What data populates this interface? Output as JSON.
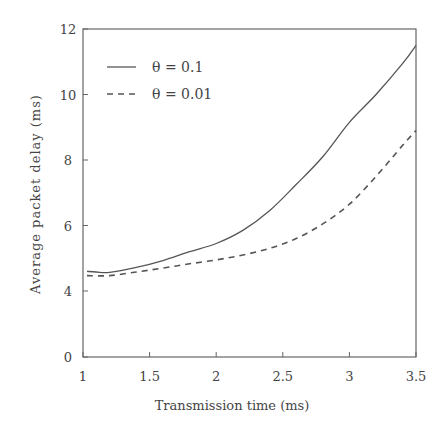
{
  "chart_data": {
    "type": "line",
    "title": "",
    "xlabel": "Transmission time (ms)",
    "ylabel": "Average packet delay (ms)",
    "xlim": [
      1,
      3.5
    ],
    "ylim": [
      0,
      12
    ],
    "y_axis_break": "axis jumps from 0 directly to 4 (no 2 tick)",
    "x_ticks": [
      "1",
      "1.5",
      "2",
      "2.5",
      "3",
      "3.5"
    ],
    "y_ticks": [
      "0",
      "4",
      "6",
      "8",
      "10",
      "12"
    ],
    "grid": false,
    "legend_position": "upper left",
    "series": [
      {
        "name": "θ = 0.1",
        "style": "solid",
        "x": [
          1.03,
          1.1,
          1.2,
          1.4,
          1.6,
          1.8,
          2.0,
          2.2,
          2.4,
          2.6,
          2.8,
          3.0,
          3.2,
          3.4,
          3.5
        ],
        "values": [
          4.6,
          4.58,
          4.57,
          4.72,
          4.93,
          5.2,
          5.45,
          5.85,
          6.45,
          7.25,
          8.1,
          9.15,
          10.0,
          10.95,
          11.5
        ]
      },
      {
        "name": "θ = 0.01",
        "style": "dashed",
        "x": [
          1.03,
          1.2,
          1.4,
          1.6,
          1.8,
          2.0,
          2.2,
          2.4,
          2.6,
          2.8,
          3.0,
          3.2,
          3.4,
          3.5
        ],
        "values": [
          4.47,
          4.47,
          4.58,
          4.7,
          4.83,
          4.95,
          5.1,
          5.3,
          5.6,
          6.05,
          6.65,
          7.5,
          8.45,
          8.9
        ]
      }
    ]
  },
  "legend": {
    "items": [
      {
        "label": "θ = 0.1",
        "style": "solid"
      },
      {
        "label": "θ = 0.01",
        "style": "dashed"
      }
    ]
  },
  "axes": {
    "xlabel": "Transmission time (ms)",
    "ylabel": "Average packet delay (ms)"
  },
  "colors": {
    "line": "#555555",
    "axis": "#666666"
  }
}
